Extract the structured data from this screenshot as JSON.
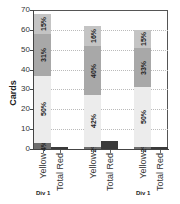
{
  "chart_data": {
    "type": "bar",
    "stacked": true,
    "title": "",
    "xlabel": "",
    "ylabel": "Cards",
    "ylim": [
      0,
      70
    ],
    "yticks": [
      0,
      10,
      20,
      30,
      40,
      50,
      60,
      70
    ],
    "grid": "horizontal dotted",
    "categories": [
      "Yellow",
      "Total Red",
      "Yellow",
      "Total Red",
      "Yellow",
      "Total Red"
    ],
    "group_labels": [
      "Div 1",
      "",
      "Div 1"
    ],
    "bars": [
      {
        "category": "Yellow",
        "total": 68,
        "segments": [
          {
            "label": "4%",
            "value": 3,
            "color": "#6e6e6e"
          },
          {
            "label": "50%",
            "value": 34,
            "color": "#ececec"
          },
          {
            "label": "31%",
            "value": 21,
            "color": "#a8a8a8"
          },
          {
            "label": "15%",
            "value": 10,
            "color": "#c4c4c4"
          }
        ]
      },
      {
        "category": "Total Red",
        "total": 1,
        "segments": [
          {
            "label": "",
            "value": 1,
            "color": "#3a3a3a"
          }
        ]
      },
      {
        "category": "Yellow",
        "total": 62,
        "segments": [
          {
            "label": "2%",
            "value": 1,
            "color": "#6e6e6e"
          },
          {
            "label": "42%",
            "value": 26,
            "color": "#ececec"
          },
          {
            "label": "40%",
            "value": 25,
            "color": "#a8a8a8"
          },
          {
            "label": "16%",
            "value": 10,
            "color": "#c4c4c4"
          }
        ]
      },
      {
        "category": "Total Red",
        "total": 4,
        "segments": [
          {
            "label": "",
            "value": 4,
            "color": "#3a3a3a"
          }
        ]
      },
      {
        "category": "Yellow",
        "total": 60,
        "segments": [
          {
            "label": "2%",
            "value": 1,
            "color": "#6e6e6e"
          },
          {
            "label": "50%",
            "value": 30,
            "color": "#ececec"
          },
          {
            "label": "33%",
            "value": 20,
            "color": "#a8a8a8"
          },
          {
            "label": "15%",
            "value": 9,
            "color": "#c4c4c4"
          }
        ]
      },
      {
        "category": "Total Red",
        "total": 1,
        "segments": [
          {
            "label": "",
            "value": 1,
            "color": "#3a3a3a"
          }
        ]
      }
    ]
  },
  "layout": {
    "bar_x": [
      34,
      51,
      84,
      101,
      134,
      151
    ],
    "bar_width": 17,
    "group_label_x": [
      36,
      136
    ]
  }
}
